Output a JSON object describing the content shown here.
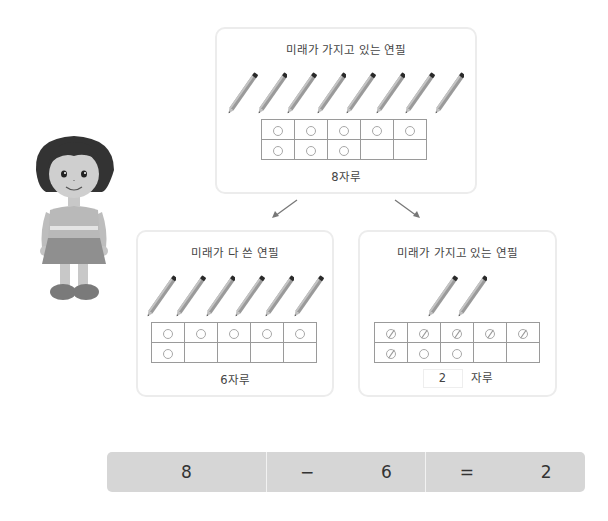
{
  "top_card": {
    "title": "미래가 가지고 있는 연필",
    "pencil_count": 8,
    "frame": [
      [
        "filled",
        "filled",
        "filled",
        "filled",
        "filled"
      ],
      [
        "filled",
        "filled",
        "filled",
        "empty",
        "empty"
      ]
    ],
    "caption": "8자루"
  },
  "left_card": {
    "title": "미래가 다 쓴 연필",
    "pencil_count": 6,
    "frame": [
      [
        "filled",
        "filled",
        "filled",
        "filled",
        "filled"
      ],
      [
        "filled",
        "empty",
        "empty",
        "empty",
        "empty"
      ]
    ],
    "caption": "6자루"
  },
  "right_card": {
    "title": "미래가 가지고 있는 연필",
    "pencil_count": 2,
    "frame": [
      [
        "crossed",
        "crossed",
        "crossed",
        "crossed",
        "crossed"
      ],
      [
        "crossed",
        "filled",
        "filled",
        "empty",
        "empty"
      ]
    ],
    "answer_value": "2",
    "caption_unit": "자루"
  },
  "equation": {
    "minuend": "8",
    "operator": "−",
    "subtrahend": "6",
    "equals": "=",
    "result": "2"
  },
  "colors": {
    "card_border": "#ececec",
    "equation_bg": "#d6d6d6",
    "frame_line": "#9a9a9a"
  }
}
